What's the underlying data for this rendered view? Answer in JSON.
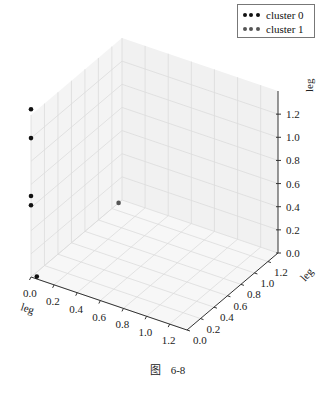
{
  "chart_data": {
    "type": "scatter",
    "projection": "3d",
    "title": "",
    "xlabel": "leg",
    "ylabel": "leg",
    "zlabel": "leg",
    "xlim": [
      0.0,
      1.35
    ],
    "ylim": [
      0.0,
      1.35
    ],
    "zlim": [
      0.0,
      1.4
    ],
    "x_ticks": [
      "0.0",
      "0.2",
      "0.4",
      "0.6",
      "0.8",
      "1.0",
      "1.2"
    ],
    "y_ticks": [
      "0.0",
      "0.2",
      "0.4",
      "0.6",
      "0.8",
      "1.0",
      "1.2"
    ],
    "z_ticks": [
      "0.0",
      "0.2",
      "0.4",
      "0.6",
      "0.8",
      "1.0",
      "1.2"
    ],
    "grid": true,
    "legend": {
      "placement": "top-right",
      "entries": [
        {
          "label": "cluster 0",
          "color": "#111111"
        },
        {
          "label": "cluster 1",
          "color": "#555555"
        }
      ]
    },
    "series": [
      {
        "name": "cluster 0",
        "color": "#111111",
        "points": [
          {
            "x": 0.0,
            "y": 0.0,
            "z": 1.45
          },
          {
            "x": 0.0,
            "y": 0.0,
            "z": 1.2
          },
          {
            "x": 0.0,
            "y": 0.0,
            "z": 0.7
          },
          {
            "x": 0.0,
            "y": 0.0,
            "z": 0.62
          },
          {
            "x": 0.05,
            "y": 0.0,
            "z": 0.02
          }
        ]
      },
      {
        "name": "cluster 1",
        "color": "#555555",
        "points": [
          {
            "x": 0.0,
            "y": 1.3,
            "z": 0.0
          }
        ]
      }
    ]
  },
  "figure": {
    "caption_prefix": "图",
    "caption_number": "6-8"
  }
}
